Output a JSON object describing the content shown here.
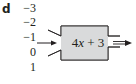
{
  "part_label": "d",
  "inputs": [
    "−3",
    "−2",
    "−1",
    "0",
    "1"
  ],
  "machine": {
    "expression_prefix": "4",
    "expression_var": "x",
    "expression_suffix": " + 3",
    "fill_color": "#d9dadb",
    "stroke_color": "#231f20"
  }
}
